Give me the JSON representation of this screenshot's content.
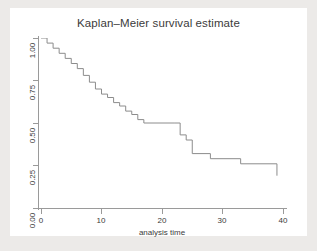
{
  "figure": {
    "title": "Kaplan–Meier survival estimate",
    "background_color": "#eceae8",
    "plot_background_color": "#ffffff",
    "axis_color": "#9a9a9a",
    "line_color": "#8c8c8c",
    "text_color": "#3b3b3b"
  },
  "axes": {
    "x_title": "analysis time",
    "y_title": "",
    "x_ticks": [
      "0",
      "10",
      "20",
      "30",
      "40"
    ],
    "y_ticks": [
      "0.00",
      "0.25",
      "0.50",
      "0.75",
      "1.00"
    ]
  },
  "chart_data": {
    "type": "line",
    "subtype": "step-post",
    "title": "Kaplan–Meier survival estimate",
    "xlabel": "analysis time",
    "ylabel": "",
    "xlim": [
      0,
      40
    ],
    "ylim": [
      0,
      1
    ],
    "xticks": [
      0,
      10,
      20,
      30,
      40
    ],
    "yticks": [
      0.0,
      0.25,
      0.5,
      0.75,
      1.0
    ],
    "grid": false,
    "legend": "none",
    "series": [
      {
        "name": "Survival probability",
        "x": [
          0,
          1,
          2,
          3,
          4,
          5,
          6,
          7,
          8,
          9,
          10,
          11,
          12,
          13,
          14,
          15,
          16,
          17,
          22,
          23,
          24,
          25,
          28,
          33,
          39
        ],
        "y": [
          1.0,
          0.97,
          0.94,
          0.91,
          0.88,
          0.85,
          0.82,
          0.78,
          0.74,
          0.7,
          0.67,
          0.65,
          0.62,
          0.6,
          0.57,
          0.55,
          0.52,
          0.5,
          0.5,
          0.43,
          0.4,
          0.32,
          0.29,
          0.26,
          0.19
        ]
      }
    ]
  }
}
